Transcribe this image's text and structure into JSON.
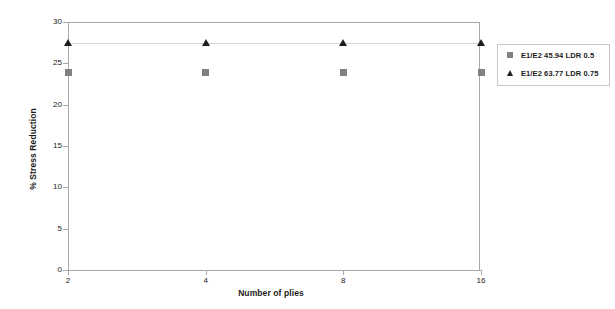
{
  "chart_data": {
    "type": "scatter",
    "title": "",
    "xlabel": "Number of plies",
    "ylabel": "% Stress Reduction",
    "categories": [
      "2",
      "4",
      "8",
      "16"
    ],
    "xticklabels": [
      "2",
      "4",
      "8",
      "16"
    ],
    "yticklabels": [
      "0",
      "5",
      "10",
      "15",
      "20",
      "25",
      "30"
    ],
    "yticks": [
      0,
      5,
      10,
      15,
      20,
      25,
      30
    ],
    "ylim": [
      0,
      30
    ],
    "grid": false,
    "legend_position": "right",
    "series": [
      {
        "name": "E1/E2 45.94 LDR 0.5",
        "marker": "square",
        "color": "#808080",
        "values": [
          23.9,
          23.9,
          23.9,
          23.9
        ],
        "connected": false
      },
      {
        "name": "E1/E2 63.77 LDR 0.75",
        "marker": "triangle",
        "color": "#1f1f1f",
        "values": [
          27.5,
          27.5,
          27.5,
          27.5
        ],
        "connected": true
      }
    ]
  },
  "legend": {
    "entries": [
      {
        "label": "E1/E2 45.94 LDR 0.5",
        "marker": "square-marker-icon"
      },
      {
        "label": "E1/E2 63.77 LDR 0.75",
        "marker": "triangle-marker-icon"
      }
    ]
  },
  "axes": {
    "y_title": "% Stress Reduction",
    "x_title": "Number of plies"
  }
}
